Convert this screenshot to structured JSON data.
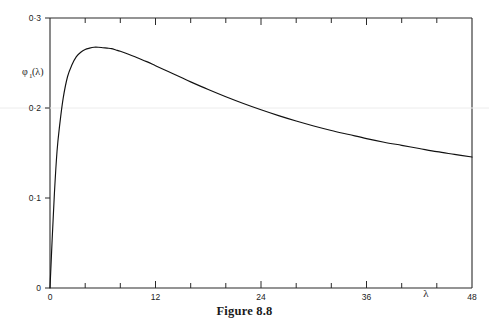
{
  "caption": "Figure 8.8",
  "axes": {
    "x_label": "λ",
    "y_label_main": "φ",
    "y_label_sub": "1",
    "y_label_arg": "(λ)",
    "x_ticklabels": [
      "0",
      "12",
      "24",
      "36",
      "48"
    ],
    "y_ticklabels": [
      "0",
      "0·1",
      "0·2",
      "0·3"
    ]
  },
  "chart_data": {
    "type": "line",
    "title": "Figure 8.8",
    "xlabel": "λ",
    "ylabel": "φ₁(λ)",
    "xlim": [
      0,
      48
    ],
    "ylim": [
      0,
      0.3
    ],
    "xticks": [
      0,
      12,
      24,
      36,
      48
    ],
    "yticks": [
      0,
      0.1,
      0.2,
      0.3
    ],
    "xminorticks": [
      4,
      8,
      16,
      20,
      28,
      32,
      40,
      44
    ],
    "grid": false,
    "legend": null,
    "line_color": "#111111",
    "series": [
      {
        "name": "φ₁(λ)",
        "x": [
          0.0,
          0.25,
          0.5,
          0.8,
          1.1,
          1.5,
          2.0,
          2.5,
          3.0,
          3.5,
          4.0,
          4.5,
          5.0,
          5.5,
          6.0,
          6.5,
          7.0,
          7.5,
          8.0,
          9.0,
          10.0,
          11.0,
          12.0,
          13.0,
          14.0,
          15.0,
          16.0,
          18.0,
          20.0,
          22.0,
          24.0,
          26.0,
          28.0,
          30.0,
          32.0,
          34.0,
          36.0,
          38.0,
          40.0,
          42.0,
          44.0,
          46.0,
          48.0
        ],
        "y": [
          0.0,
          0.055,
          0.105,
          0.152,
          0.181,
          0.211,
          0.235,
          0.248,
          0.257,
          0.262,
          0.265,
          0.2665,
          0.2675,
          0.2675,
          0.267,
          0.2665,
          0.266,
          0.2645,
          0.263,
          0.2595,
          0.2555,
          0.2515,
          0.247,
          0.2425,
          0.238,
          0.2335,
          0.229,
          0.2205,
          0.2125,
          0.205,
          0.198,
          0.1915,
          0.1855,
          0.18,
          0.175,
          0.1705,
          0.166,
          0.162,
          0.1585,
          0.155,
          0.1515,
          0.1485,
          0.1455
        ]
      }
    ],
    "annotations": {
      "peak_value": 0.268,
      "peak_lambda": 5.2,
      "end_value": 0.146
    }
  }
}
